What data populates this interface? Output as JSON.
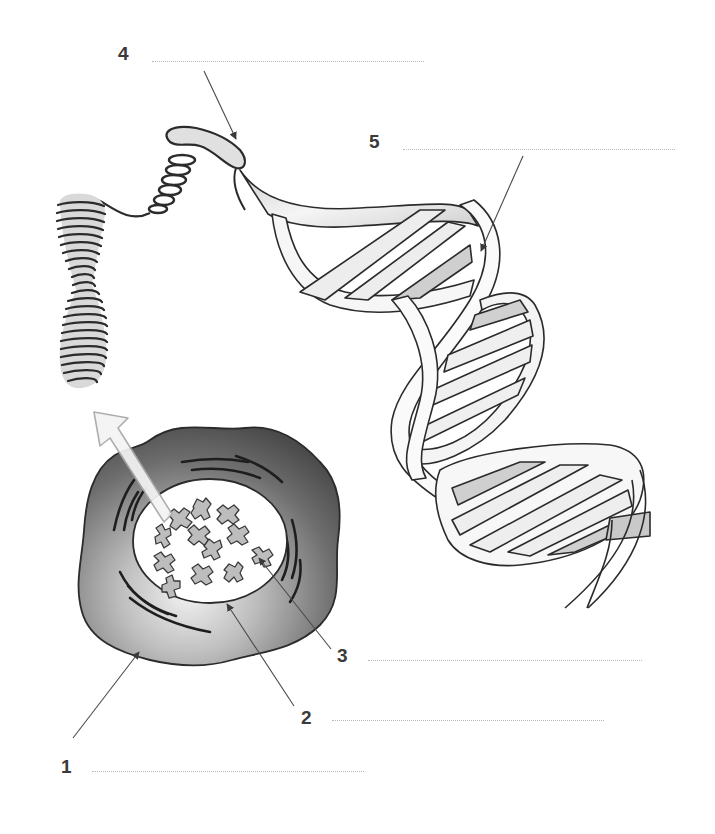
{
  "diagram": {
    "type": "labeling worksheet",
    "colors": {
      "ink": "#2b2b2b",
      "pointer": "#5a5a5a",
      "cytoplasm_dark": "#5c5c5c",
      "cytoplasm_light": "#e6e6e6",
      "nucleus_fill": "#ffffff",
      "chromosome_fill": "#bdbdbd",
      "chromatin_fill": "#d9d9d9",
      "strand_fill": "#f2f2f2",
      "strand_shade": "#c4c4c4",
      "blank_line": "#b8b8b8",
      "number_text": "#3a3a3a",
      "big_arrow_fill": "#f4f4f4",
      "big_arrow_stroke": "#a8a8a8"
    },
    "components": [
      "cell",
      "nucleus",
      "chromosomes",
      "condensed chromosome / chromatin coil",
      "supercoiled fiber loop",
      "DNA double helix"
    ]
  },
  "labels": [
    {
      "number": "1",
      "answer": "",
      "points_to": "cell membrane / cell"
    },
    {
      "number": "2",
      "answer": "",
      "points_to": "nucleus (nuclear membrane)"
    },
    {
      "number": "3",
      "answer": "",
      "points_to": "chromosome"
    },
    {
      "number": "4",
      "answer": "",
      "points_to": "coiled fiber (chromatin)"
    },
    {
      "number": "5",
      "answer": "",
      "points_to": "DNA double helix strand"
    }
  ]
}
